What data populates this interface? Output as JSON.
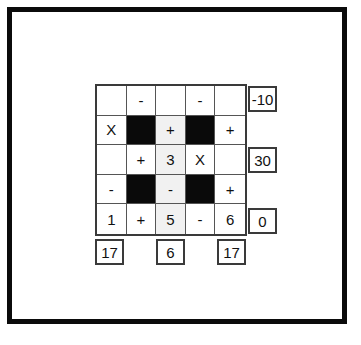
{
  "frame": {
    "border_color": "#0b0b0b",
    "background": "#ffffff"
  },
  "puzzle": {
    "kind": "arithmetic-cross-sums-grid",
    "rows": 5,
    "columns": 5,
    "blocked_color": "#0a0a0a",
    "tint_color": "#f1f1f1",
    "grid": [
      [
        {
          "text": "",
          "state": "empty"
        },
        {
          "text": "-",
          "state": "operator"
        },
        {
          "text": "",
          "state": "empty"
        },
        {
          "text": "-",
          "state": "operator"
        },
        {
          "text": "",
          "state": "empty"
        }
      ],
      [
        {
          "text": "X",
          "state": "operator"
        },
        {
          "text": "",
          "state": "blocked"
        },
        {
          "text": "+",
          "state": "operator-tinted"
        },
        {
          "text": "",
          "state": "blocked"
        },
        {
          "text": "+",
          "state": "operator"
        }
      ],
      [
        {
          "text": "",
          "state": "empty"
        },
        {
          "text": "+",
          "state": "operator"
        },
        {
          "text": "3",
          "state": "number-tinted"
        },
        {
          "text": "X",
          "state": "operator"
        },
        {
          "text": "",
          "state": "empty"
        }
      ],
      [
        {
          "text": "-",
          "state": "operator"
        },
        {
          "text": "",
          "state": "blocked"
        },
        {
          "text": "-",
          "state": "operator-tinted"
        },
        {
          "text": "",
          "state": "blocked"
        },
        {
          "text": "+",
          "state": "operator"
        }
      ],
      [
        {
          "text": "1",
          "state": "number"
        },
        {
          "text": "+",
          "state": "operator"
        },
        {
          "text": "5",
          "state": "number-tinted"
        },
        {
          "text": "-",
          "state": "operator"
        },
        {
          "text": "6",
          "state": "number"
        }
      ]
    ],
    "row_results": [
      {
        "row_index": 0,
        "value": "-10"
      },
      {
        "row_index": 2,
        "value": "30"
      },
      {
        "row_index": 4,
        "value": "0"
      }
    ],
    "column_totals": [
      {
        "column_index": 0,
        "value": "17"
      },
      {
        "column_index": 2,
        "value": "6"
      },
      {
        "column_index": 4,
        "value": "17"
      }
    ]
  },
  "chart_data": {
    "type": "table",
    "title": "",
    "categories": [
      "col1",
      "col2",
      "col3",
      "col4",
      "col5"
    ],
    "row_results": [
      "-10",
      "",
      "30",
      "",
      "0"
    ],
    "column_totals": [
      "17",
      "",
      "6",
      "",
      "17"
    ],
    "cells": [
      [
        "",
        "-",
        "",
        "-",
        ""
      ],
      [
        "X",
        "#",
        "+",
        "#",
        "+"
      ],
      [
        "",
        "+",
        "3",
        "X",
        ""
      ],
      [
        "-",
        "#",
        "-",
        "#",
        "+"
      ],
      [
        "1",
        "+",
        "5",
        "-",
        "6"
      ]
    ],
    "legend": [
      "# = blocked/black cell"
    ]
  }
}
